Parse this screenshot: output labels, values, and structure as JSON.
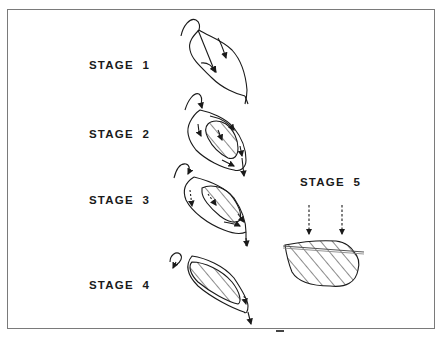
{
  "figure": {
    "stages": [
      {
        "id": 1,
        "label": "STAGE  1",
        "description": "Initial surface with flow arrows"
      },
      {
        "id": 2,
        "label": "STAGE  2",
        "description": "Hatched core forming within outer ring with arrows"
      },
      {
        "id": 3,
        "label": "STAGE  3",
        "description": "Larger hatched core with dashed and solid arrows"
      },
      {
        "id": 4,
        "label": "STAGE  4",
        "description": "Mostly hatched body with thin rim and outflow arrow"
      },
      {
        "id": 5,
        "label": "STAGE  5",
        "description": "Hatched body with truncated top and two dashed downward arrows"
      }
    ],
    "colors": {
      "ink": "#1a1a1a",
      "frame": "#7a7a7a",
      "background": "#ffffff"
    }
  }
}
